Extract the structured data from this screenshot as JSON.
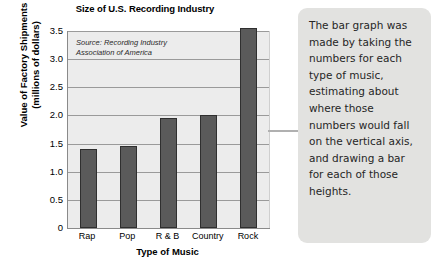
{
  "chart_data": {
    "type": "bar",
    "title": "Size of U.S. Recording Industry",
    "xlabel": "Type of Music",
    "ylabel": "Value of Factory Shipments (millions of dollars)",
    "ylabel_line1": "Value of Factory Shipments",
    "ylabel_line2": "(millions of dollars)",
    "categories": [
      "Rap",
      "Pop",
      "R & B",
      "Country",
      "Rock"
    ],
    "values": [
      1.4,
      1.45,
      1.95,
      2.0,
      3.55
    ],
    "ylim": [
      0,
      3.5
    ],
    "ytick_labels": [
      "3.5",
      "3.0",
      "2.5",
      "2.0",
      "1.5",
      "1.0",
      "0.5",
      "0"
    ],
    "ytick_values": [
      3.5,
      3.0,
      2.5,
      2.0,
      1.5,
      1.0,
      0.5,
      0
    ],
    "grid": true,
    "legend": "none",
    "bar_color": "#5a5a5a",
    "plot_background": "#ececec",
    "annotations": {
      "source_line1": "Source: Recording Industry",
      "source_line2": "Association of America"
    }
  },
  "callout": {
    "text": "The bar graph was made by taking the numbers for each type of music, estimating about where those numbers would fall on the vertical axis, and drawing a bar for each of those heights."
  }
}
